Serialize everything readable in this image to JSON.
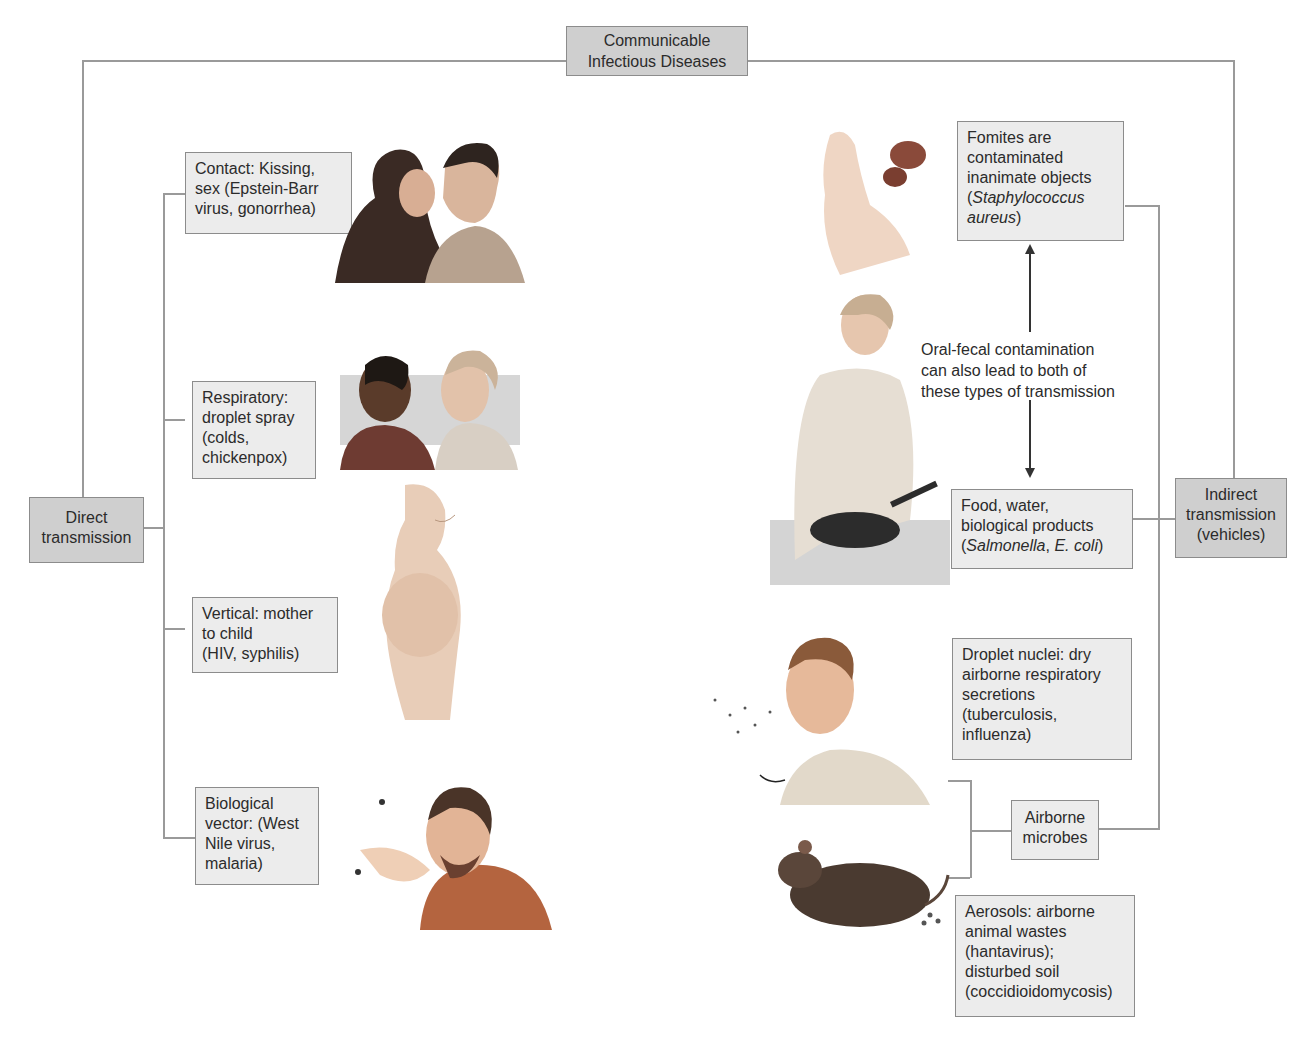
{
  "title": {
    "line1": "Communicable",
    "line2": "Infectious Diseases"
  },
  "direct": {
    "label_line1": "Direct",
    "label_line2": "transmission",
    "items": [
      {
        "name": "contact",
        "lines": [
          "Contact: Kissing,",
          "sex (Epstein-Barr",
          "virus, gonorrhea)"
        ],
        "illustration": "two people kissing"
      },
      {
        "name": "respiratory",
        "lines": [
          "Respiratory:",
          "droplet spray",
          "(colds,",
          "chickenpox)"
        ],
        "illustration": "two women talking"
      },
      {
        "name": "vertical",
        "lines": [
          "Vertical: mother",
          "to child",
          "(HIV, syphilis)"
        ],
        "illustration": "pregnant woman"
      },
      {
        "name": "vector",
        "lines": [
          "Biological",
          "vector: (West",
          "Nile virus,",
          "malaria)"
        ],
        "illustration": "man swatting mosquito"
      }
    ]
  },
  "indirect": {
    "label_line1": "Indirect",
    "label_line2": "transmission",
    "label_line3": "(vehicles)",
    "fomites": {
      "lines": [
        "Fomites are",
        "contaminated",
        "inanimate objects"
      ],
      "italic_line1": "Staphylococcus",
      "italic_line2": "aureus"
    },
    "oral_fecal_note": [
      "Oral-fecal contamination",
      "can also lead to both of",
      "these types of transmission"
    ],
    "food": {
      "lines": [
        "Food, water,",
        "biological products"
      ],
      "italic1": "Salmonella",
      "italic2": "E. coli"
    },
    "droplet_nuclei": {
      "lines": [
        "Droplet nuclei: dry",
        "airborne respiratory",
        "secretions",
        "(tuberculosis,",
        "influenza)"
      ]
    },
    "airborne": {
      "line1": "Airborne",
      "line2": "microbes"
    },
    "aerosols": {
      "lines": [
        "Aerosols: airborne",
        "animal wastes",
        "(hantavirus);",
        "disturbed soil",
        "(coccidioidomycosis)"
      ]
    }
  },
  "colors": {
    "dark_box": "#cfcfcf",
    "light_box": "#ececec",
    "line": "#9a9a9a"
  }
}
